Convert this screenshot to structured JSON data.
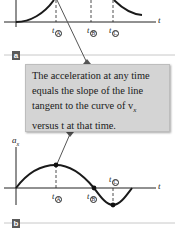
{
  "panel_a": {
    "label": "a",
    "axis_x_label": "t",
    "ticks": [
      {
        "var": "t",
        "sub": "A"
      },
      {
        "var": "t",
        "sub": "B"
      },
      {
        "var": "t",
        "sub": "C"
      }
    ]
  },
  "callout": {
    "lines": [
      "The acceleration at any time",
      "equals the slope of the line",
      "tangent to the curve of v",
      "versus t at that time."
    ],
    "line3_subscript": "x"
  },
  "panel_b": {
    "label": "b",
    "axis_y_label": "a",
    "axis_y_subscript": "x",
    "axis_x_label": "t",
    "ticks": [
      {
        "var": "t",
        "sub": "A"
      },
      {
        "var": "t",
        "sub": "B"
      },
      {
        "var": "t",
        "sub": "C"
      }
    ]
  },
  "colors": {
    "curve": "#1a1a1a",
    "callout_fill": "#d4d4d4",
    "divider": "#c8c8c8",
    "label_box": "#5a5a5a"
  }
}
